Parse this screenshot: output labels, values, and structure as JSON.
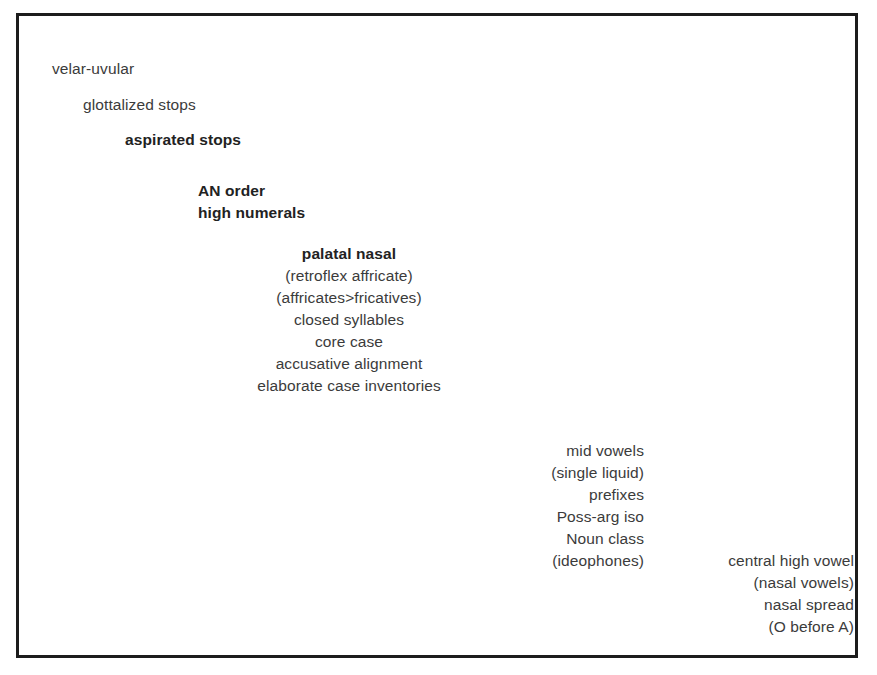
{
  "figure": {
    "border_color": "#1c1c1c",
    "text_color": "#3b3b3b",
    "bold_text_color": "#222222",
    "background": "#ffffff",
    "groups": [
      {
        "name": "velar-uvular",
        "align": "left",
        "lines": [
          {
            "text": "velar-uvular",
            "bold": false
          }
        ]
      },
      {
        "name": "glottalized-stops",
        "align": "left",
        "lines": [
          {
            "text": "glottalized stops",
            "bold": false
          }
        ]
      },
      {
        "name": "aspirated-stops",
        "align": "left",
        "lines": [
          {
            "text": "aspirated stops",
            "bold": true
          }
        ]
      },
      {
        "name": "an-order",
        "align": "left",
        "lines": [
          {
            "text": "AN order",
            "bold": true
          },
          {
            "text": "high numerals",
            "bold": true
          }
        ]
      },
      {
        "name": "palatal-nasal",
        "align": "center",
        "lines": [
          {
            "text": "palatal nasal",
            "bold": true
          },
          {
            "text": "(retroflex affricate)",
            "bold": false
          },
          {
            "text": "(affricates>fricatives)",
            "bold": false
          },
          {
            "text": "closed syllables",
            "bold": false
          },
          {
            "text": "core case",
            "bold": false
          },
          {
            "text": "accusative alignment",
            "bold": false
          },
          {
            "text": "elaborate case inventories",
            "bold": false
          }
        ]
      },
      {
        "name": "mid-vowels",
        "align": "right",
        "lines": [
          {
            "text": "mid vowels",
            "bold": false
          },
          {
            "text": "(single liquid)",
            "bold": false
          },
          {
            "text": "prefixes",
            "bold": false
          },
          {
            "text": "Poss-arg iso",
            "bold": false
          },
          {
            "text": "Noun class",
            "bold": false
          },
          {
            "text": "(ideophones)",
            "bold": false
          }
        ]
      },
      {
        "name": "central-high-vowel",
        "align": "right",
        "lines": [
          {
            "text": "central high vowel",
            "bold": false
          },
          {
            "text": "(nasal vowels)",
            "bold": false
          },
          {
            "text": "nasal spread",
            "bold": false
          },
          {
            "text": "(O before A)",
            "bold": false
          }
        ]
      }
    ]
  }
}
